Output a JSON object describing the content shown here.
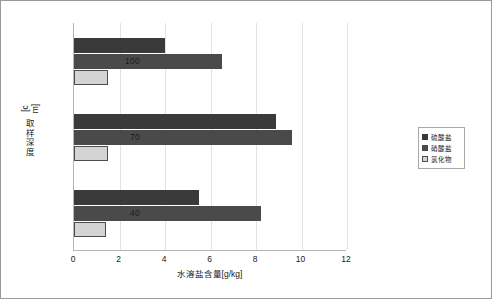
{
  "chart_data": {
    "type": "bar",
    "orientation": "horizontal",
    "title": "",
    "xlabel": "水溶盐含量[g/kg]",
    "ylabel": "取样深度[cm]",
    "categories": [
      "100",
      "70",
      "40"
    ],
    "xlim": [
      0,
      12
    ],
    "xticks": [
      0,
      2,
      4,
      6,
      8,
      10,
      12
    ],
    "grid": true,
    "legend_position": "right",
    "series": [
      {
        "name": "硫酸盐",
        "color": "#3a3a3a",
        "values": [
          4.0,
          8.9,
          5.5
        ]
      },
      {
        "name": "硝酸盐",
        "color": "#4a4a4a",
        "values": [
          6.5,
          9.6,
          8.2
        ]
      },
      {
        "name": "氯化物",
        "color": "#d4d4d4",
        "values": [
          1.5,
          1.5,
          1.4
        ]
      }
    ]
  }
}
